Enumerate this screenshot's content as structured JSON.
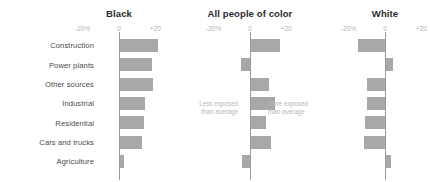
{
  "chart_data": {
    "type": "bar",
    "title": "",
    "subtitle": "",
    "xlabel": "",
    "ylabel": "",
    "orientation": "horizontal",
    "grid": false,
    "legend": "none",
    "xlim": [
      -20,
      20
    ],
    "xticks": [
      -20,
      0,
      20
    ],
    "xtick_labels": [
      "-20%",
      "0",
      "+20"
    ],
    "categories": [
      "Construction",
      "Power plants",
      "Other sources",
      "Industrial",
      "Residential",
      "Cars and trucks",
      "Agriculture"
    ],
    "panels": [
      {
        "name": "Black",
        "values": [
          21.0,
          17.5,
          18.0,
          14.0,
          13.0,
          12.0,
          2.0
        ]
      },
      {
        "name": "All people of color",
        "values": [
          16.0,
          -5.0,
          10.0,
          13.0,
          8.0,
          11.0,
          -4.5
        ]
      },
      {
        "name": "White",
        "values": [
          -15.0,
          4.0,
          -10.0,
          -10.0,
          -11.0,
          -11.5,
          3.0
        ]
      }
    ],
    "annotations": [
      {
        "text_line1": "Less exposed",
        "text_line2": "than average",
        "side": "left"
      },
      {
        "text_line1": "More exposed",
        "text_line2": "than average",
        "side": "right"
      }
    ],
    "colors": {
      "bar": "#a8a8a8",
      "axis": "#9a9a9a",
      "tick_text": "#b2b2b2",
      "category_text": "#4a4a4a",
      "title_text": "#2b2b2b",
      "annotation_text": "#b8b8b8",
      "background": "#ffffff"
    }
  }
}
